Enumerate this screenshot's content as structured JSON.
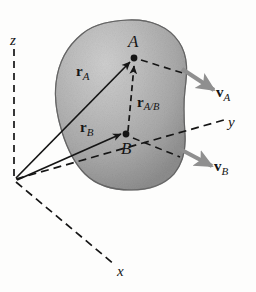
{
  "figure": {
    "background_color": "#fdfdfc",
    "body_fill_color": "#a9a9a9",
    "body_outline_color": "#6e6e6e",
    "line_color": "#151515",
    "velocity_arrow_color": "#8f8f8f"
  },
  "axes": {
    "z_label": "z",
    "y_label": "y",
    "x_label": "x",
    "origin_label": ""
  },
  "points": {
    "a_label": "A",
    "b_label": "B"
  },
  "vectors": {
    "r_a": {
      "symbol": "r",
      "subscript": "A"
    },
    "r_b": {
      "symbol": "r",
      "subscript": "B"
    },
    "r_ab": {
      "symbol": "r",
      "subscript": "A/B"
    },
    "v_a": {
      "symbol": "v",
      "subscript": "A"
    },
    "v_b": {
      "symbol": "v",
      "subscript": "B"
    }
  }
}
